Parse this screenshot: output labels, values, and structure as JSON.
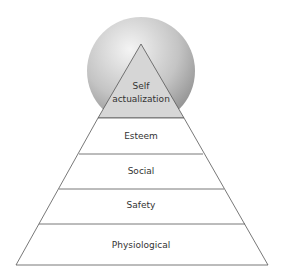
{
  "diagram": {
    "type": "hierarchy-pyramid",
    "colors": {
      "sphere_light": "#f2f2f2",
      "sphere_dark": "#9a9a9a",
      "apex_fill": "#d4d4d4",
      "line": "#555555",
      "text": "#333333"
    },
    "levels": [
      {
        "label": "Self actualization",
        "line1": "Self",
        "line2": "actualization"
      },
      {
        "label": "Esteem"
      },
      {
        "label": "Social"
      },
      {
        "label": "Safety"
      },
      {
        "label": "Physiological"
      }
    ]
  }
}
